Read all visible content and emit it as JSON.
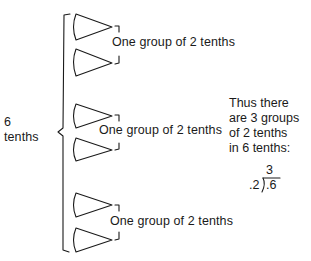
{
  "whole": {
    "number": "6",
    "unit": "tenths"
  },
  "groups": [
    {
      "label": "One group of 2 tenths",
      "items": 2,
      "item_shape": "wedge-triangle"
    },
    {
      "label": "One group of 2 tenths",
      "items": 2,
      "item_shape": "wedge-triangle"
    },
    {
      "label": "One group of 2 tenths",
      "items": 2,
      "item_shape": "wedge-triangle"
    }
  ],
  "conclusion": {
    "lines": [
      "Thus there",
      "are 3 groups",
      "of 2 tenths",
      "in 6 tenths:"
    ]
  },
  "division": {
    "quotient": "3",
    "divisor": ".2",
    "dividend": ".6"
  }
}
